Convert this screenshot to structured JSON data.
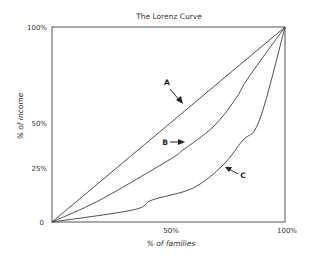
{
  "chart_data": {
    "type": "line",
    "title": "The Lorenz Curve",
    "xlabel": "% of families",
    "ylabel": "% of income",
    "xlim": [
      0,
      100
    ],
    "ylim": [
      0,
      100
    ],
    "x_ticks": [
      "50%",
      "100%"
    ],
    "x_tick_values": [
      50,
      100
    ],
    "y_ticks": [
      "0",
      "25%",
      "50%",
      "100%"
    ],
    "y_tick_values": [
      0,
      25,
      50,
      100
    ],
    "grid": false,
    "legend": "none (inline arrow annotations A, B, C)",
    "series": [
      {
        "name": "A",
        "description": "Line of perfect equality",
        "x": [
          0,
          100
        ],
        "y": [
          0,
          100
        ]
      },
      {
        "name": "B",
        "x": [
          0,
          20.6,
          50.2,
          56.2,
          69.1,
          78.5,
          84.5,
          100
        ],
        "y": [
          0,
          11.3,
          31.8,
          36.9,
          48.7,
          62.6,
          74.4,
          100
        ]
      },
      {
        "name": "C",
        "x": [
          0,
          34.8,
          43.0,
          60.5,
          73.4,
          82.0,
          87.1,
          91.8,
          100
        ],
        "y": [
          0,
          6.2,
          11.3,
          17.4,
          29.2,
          42.1,
          47.2,
          62.6,
          100
        ]
      }
    ],
    "annotations": [
      {
        "label": "A",
        "arrow_direction": "down-right",
        "points_to": "A"
      },
      {
        "label": "B",
        "arrow_direction": "right",
        "points_to": "B"
      },
      {
        "label": "C",
        "arrow_direction": "up-left",
        "points_to": "C"
      }
    ]
  }
}
